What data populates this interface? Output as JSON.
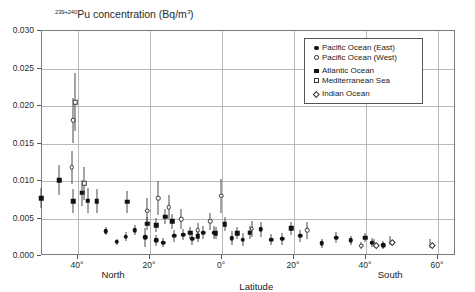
{
  "chart_data": {
    "type": "scatter",
    "title": "239+240Pu concentration (Bq/m3)",
    "title_sup": "239+240",
    "title_rest": "Pu concentration (Bq/m",
    "title_sup2": "3",
    "title_end": ")",
    "xlabel": "Latitude",
    "ylabel": "239+240Pu concentration (Bq/m3)",
    "ylim": [
      0.0,
      0.03
    ],
    "xlim": [
      50,
      -65
    ],
    "grid": true,
    "legend_position": "top-right",
    "ytick_labels": [
      "0.030",
      "0.025",
      "0.020",
      "0.015",
      "0.010",
      "0.005",
      "0.000"
    ],
    "ytick_values": [
      0.03,
      0.025,
      0.02,
      0.015,
      0.01,
      0.005,
      0.0
    ],
    "xtick_labels": [
      "40°",
      "20°",
      "0°",
      "20°",
      "40°",
      "60°"
    ],
    "xtick_values": [
      40,
      20,
      0,
      -20,
      -40,
      -60
    ],
    "hemisphere_labels": [
      {
        "text": "North",
        "lat": 30
      },
      {
        "text": "South",
        "lat": -47
      }
    ],
    "series": [
      {
        "name": "Pacific Ocean (East)",
        "marker": "filled-circle",
        "color": "#111111",
        "points": [
          {
            "lat": 32.0,
            "y": 0.0032,
            "err": 0.00055
          },
          {
            "lat": 29.0,
            "y": 0.00175,
            "err": 0.0004
          },
          {
            "lat": 26.5,
            "y": 0.00245,
            "err": 0.0006
          },
          {
            "lat": 24.0,
            "y": 0.0033,
            "err": 0.00065
          },
          {
            "lat": 21.0,
            "y": 0.00235,
            "err": 0.0013
          },
          {
            "lat": 18.0,
            "y": 0.00195,
            "err": 0.0007
          },
          {
            "lat": 16.0,
            "y": 0.00165,
            "err": 0.0006
          },
          {
            "lat": 13.0,
            "y": 0.00255,
            "err": 0.0008
          },
          {
            "lat": 10.5,
            "y": 0.0027,
            "err": 0.00075
          },
          {
            "lat": 8.0,
            "y": 0.00215,
            "err": 0.00075
          },
          {
            "lat": 5.0,
            "y": 0.003,
            "err": 0.0009
          },
          {
            "lat": 2.0,
            "y": 0.003,
            "err": 0.00085
          },
          {
            "lat": -3.0,
            "y": 0.00225,
            "err": 0.00095
          },
          {
            "lat": -6.0,
            "y": 0.00205,
            "err": 0.00085
          },
          {
            "lat": -11.0,
            "y": 0.00345,
            "err": 0.001
          },
          {
            "lat": -14.0,
            "y": 0.00205,
            "err": 0.0007
          },
          {
            "lat": -17.0,
            "y": 0.00215,
            "err": 0.0008
          },
          {
            "lat": -22.0,
            "y": 0.00255,
            "err": 0.00085
          },
          {
            "lat": -28.0,
            "y": 0.0016,
            "err": 0.0006
          },
          {
            "lat": -32.0,
            "y": 0.0023,
            "err": 0.00075
          },
          {
            "lat": -36.0,
            "y": 0.00195,
            "err": 0.00065
          },
          {
            "lat": -42.0,
            "y": 0.00165,
            "err": 0.0006
          },
          {
            "lat": -45.0,
            "y": 0.0013,
            "err": 0.00055
          }
        ]
      },
      {
        "name": "Pacific Ocean (West)",
        "marker": "open-circle",
        "color": "#333333",
        "points": [
          {
            "lat": 41.0,
            "y": 0.018,
            "err": 0.003
          },
          {
            "lat": 41.5,
            "y": 0.0117,
            "err": 0.0022
          },
          {
            "lat": 20.5,
            "y": 0.0059,
            "err": 0.0017
          },
          {
            "lat": 17.5,
            "y": 0.0076,
            "err": 0.0023
          },
          {
            "lat": 14.5,
            "y": 0.0064,
            "err": 0.00155
          },
          {
            "lat": 11.0,
            "y": 0.0048,
            "err": 0.00135
          },
          {
            "lat": 6.5,
            "y": 0.0033,
            "err": 0.001
          },
          {
            "lat": 3.0,
            "y": 0.0045,
            "err": 0.0011
          },
          {
            "lat": 0.0,
            "y": 0.0079,
            "err": 0.0023
          },
          {
            "lat": -8.5,
            "y": 0.0035,
            "err": 0.0011
          },
          {
            "lat": -24.0,
            "y": 0.0033,
            "err": 0.00115
          },
          {
            "lat": -39.0,
            "y": 0.00125,
            "err": 0.00045
          }
        ]
      },
      {
        "name": "Atlantic Ocean",
        "marker": "filled-square",
        "color": "#111111",
        "points": [
          {
            "lat": 50.0,
            "y": 0.0076,
            "err": 0.00135
          },
          {
            "lat": 45.0,
            "y": 0.01,
            "err": 0.002
          },
          {
            "lat": 41.0,
            "y": 0.00715,
            "err": 0.0016
          },
          {
            "lat": 38.5,
            "y": 0.0083,
            "err": 0.00175
          },
          {
            "lat": 37.0,
            "y": 0.00725,
            "err": 0.0017
          },
          {
            "lat": 34.5,
            "y": 0.0072,
            "err": 0.00165
          },
          {
            "lat": 26.0,
            "y": 0.0071,
            "err": 0.00145
          },
          {
            "lat": 20.5,
            "y": 0.0042,
            "err": 0.0009
          },
          {
            "lat": 18.0,
            "y": 0.004,
            "err": 0.0009
          },
          {
            "lat": 15.5,
            "y": 0.0051,
            "err": 0.001
          },
          {
            "lat": 13.5,
            "y": 0.0045,
            "err": 0.001
          },
          {
            "lat": 8.5,
            "y": 0.003,
            "err": 0.0008
          },
          {
            "lat": 6.5,
            "y": 0.0025,
            "err": 0.00075
          },
          {
            "lat": 1.5,
            "y": 0.0029,
            "err": 0.0008
          },
          {
            "lat": -1.0,
            "y": 0.0041,
            "err": 0.00095
          },
          {
            "lat": -4.5,
            "y": 0.0029,
            "err": 0.0008
          },
          {
            "lat": -8.0,
            "y": 0.003,
            "err": 0.00085
          },
          {
            "lat": -19.5,
            "y": 0.00355,
            "err": 0.00085
          },
          {
            "lat": -40.0,
            "y": 0.0023,
            "err": 0.0006
          }
        ]
      },
      {
        "name": "Mediterranean Sea",
        "marker": "open-square",
        "color": "#333333",
        "points": [
          {
            "lat": 40.5,
            "y": 0.0204,
            "err": 0.0039
          },
          {
            "lat": 38.0,
            "y": 0.0096,
            "err": 0.0022
          }
        ]
      },
      {
        "name": "Indian Ocean",
        "marker": "open-diamond",
        "color": "#333333",
        "points": [
          {
            "lat": -42.5,
            "y": 0.0016,
            "err": 0.0005
          },
          {
            "lat": -47.0,
            "y": 0.00195,
            "err": 0.0006
          },
          {
            "lat": -58.0,
            "y": 0.00155,
            "err": 0.00055
          }
        ]
      }
    ]
  },
  "legend": {
    "entries": [
      {
        "label": "Pacific Ocean (East)",
        "marker": "filled-circle"
      },
      {
        "label": "Pacific Ocean (West)",
        "marker": "open-circle"
      },
      {
        "label": "Atlantic Ocean",
        "marker": "filled-square"
      },
      {
        "label": "Mediterranean Sea",
        "marker": "open-square"
      },
      {
        "label": "Indian Ocean",
        "marker": "open-diamond"
      }
    ]
  }
}
